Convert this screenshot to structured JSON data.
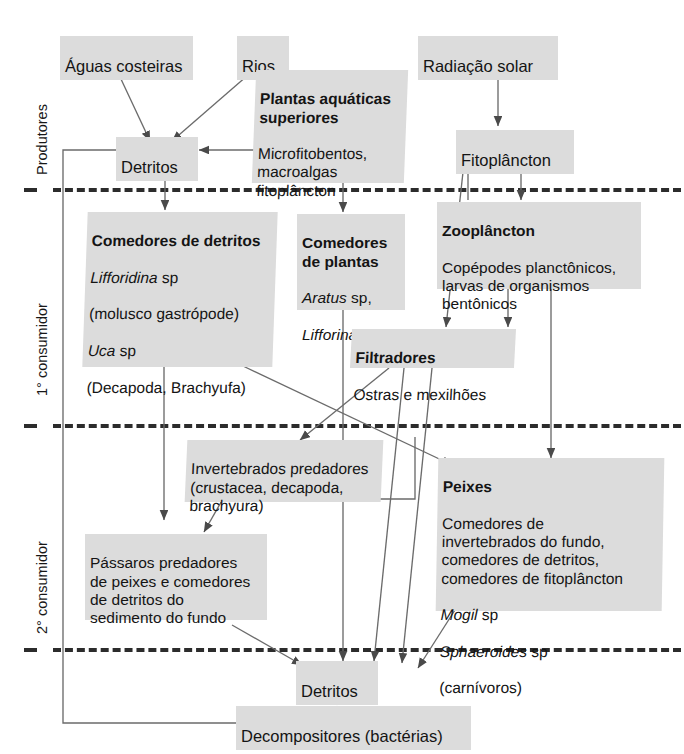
{
  "diagram": {
    "levels": [
      {
        "id": "produtores",
        "label": "Produtores"
      },
      {
        "id": "consumidor-1",
        "label": "1° consumidor"
      },
      {
        "id": "consumidor-2",
        "label": "2° consumidor"
      }
    ],
    "nodes": {
      "aguas_costeiras": {
        "title": "Águas costeiras"
      },
      "rios": {
        "title": "Rios"
      },
      "radiacao_solar": {
        "title": "Radiação solar"
      },
      "detritos_topo": {
        "title": "Detritos"
      },
      "plantas_aquaticas": {
        "title": "Plantas aquáticas superiores",
        "body": "Microfitobentos,\nmacroalgas\nfitoplâncton"
      },
      "fitoplancton": {
        "title": "Fitoplâncton"
      },
      "comedores_detritos": {
        "title": "Comedores de detritos",
        "sp1": "Lifforidina",
        "sp1_suffix": " sp",
        "sp1_note": "(molusco gastrópode)",
        "sp2": "Uca",
        "sp2_suffix": " sp",
        "sp2_note": "(Decapoda, Brachyufa)"
      },
      "comedores_plantas": {
        "title": "Comedores de plantas",
        "sp1": "Aratus",
        "sp1_suffix": " sp,",
        "sp2": "Lifforina",
        "sp2_suffix": " sp"
      },
      "zooplancton": {
        "title": "Zooplâncton",
        "body": "Copépodes planctônicos,\nlarvas de organismos\nbentônicos"
      },
      "filtradores": {
        "title": "Filtradores",
        "body": "Ostras e mexilhões"
      },
      "invertebrados_predadores": {
        "body": "Invertebrados predadores\n(crustacea, decapoda,\nbrachyura)"
      },
      "passaros_predadores": {
        "body": "Pássaros predadores\nde peixes e comedores\nde detritos do\nsedimento do fundo"
      },
      "peixes": {
        "title": "Peixes",
        "body": "Comedores de\ninvertebrados do fundo,\ncomedores de detritos,\ncomedores de fitoplâncton",
        "sp1": "Mogil",
        "sp1_suffix": " sp",
        "sp2": "Sphaeroides",
        "sp2_suffix": " sp",
        "sp2_note": "(carnívoros)"
      },
      "detritos_base": {
        "title": "Detritos"
      },
      "decompositores": {
        "title": "Decompositores (bactérias)"
      }
    },
    "colors": {
      "node_fill": "#dcdcdc",
      "text": "#141414",
      "wire": "#5a5a5a",
      "separator": "#2c2c2c",
      "background": "#ffffff"
    }
  }
}
